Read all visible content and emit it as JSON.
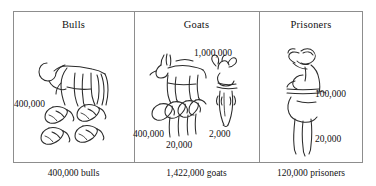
{
  "figure": {
    "ink_color": "#2b2b2b",
    "frame_color": "#8d8d8d",
    "background": "#ffffff"
  },
  "panels": [
    {
      "id": "bulls",
      "title": "Bulls",
      "caption": "400,000 bulls",
      "glyphs": [
        {
          "name": "bull-figure",
          "meaning": "bull",
          "count_label": ""
        },
        {
          "name": "lotus-flower-glyph",
          "meaning": "100,000 each",
          "count_label": "400,000"
        }
      ],
      "labels": [
        {
          "key": "bulls_400k",
          "text": "400,000"
        }
      ]
    },
    {
      "id": "goats",
      "title": "Goats",
      "caption": "1,422,000 goats",
      "glyphs": [
        {
          "name": "goat-figure",
          "meaning": "goat",
          "count_label": ""
        },
        {
          "name": "heh-god-glyph",
          "meaning": "1,000,000",
          "count_label": "1,000,000"
        },
        {
          "name": "lotus-flower-glyph",
          "meaning": "100,000 each",
          "count_label": "400,000"
        },
        {
          "name": "lotus-stem-glyph",
          "meaning": "1,000 each",
          "count_label": "20,000"
        },
        {
          "name": "coiled-rope-glyph",
          "meaning": "100 each",
          "count_label": "2,000"
        }
      ],
      "labels": [
        {
          "key": "goats_1m",
          "text": "1,000,000"
        },
        {
          "key": "goats_400k",
          "text": "400,000"
        },
        {
          "key": "goats_20k",
          "text": "20,000"
        },
        {
          "key": "goats_2k",
          "text": "2,000"
        }
      ]
    },
    {
      "id": "prisoners",
      "title": "Prisoners",
      "caption": "120,000 prisoners",
      "glyphs": [
        {
          "name": "bound-prisoner-figure",
          "meaning": "captive",
          "count_label": ""
        },
        {
          "name": "tadpole-glyph",
          "meaning": "100,000",
          "count_label": "100,000"
        },
        {
          "name": "lotus-stem-glyph",
          "meaning": "1,000 each",
          "count_label": "20,000"
        }
      ],
      "labels": [
        {
          "key": "prisoners_100k",
          "text": "100,000"
        },
        {
          "key": "prisoners_20k",
          "text": "20,000"
        }
      ]
    }
  ],
  "labels": {
    "bulls_title": "Bulls",
    "goats_title": "Goats",
    "prisoners_title": "Prisoners",
    "bulls_400k": "400,000",
    "goats_1m": "1,000,000",
    "goats_400k": "400,000",
    "goats_20k": "20,000",
    "goats_2k": "2,000",
    "prisoners_100k": "100,000",
    "prisoners_20k": "20,000",
    "bulls_caption": "400,000 bulls",
    "goats_caption": "1,422,000 goats",
    "prisoners_caption": "120,000 prisoners"
  }
}
